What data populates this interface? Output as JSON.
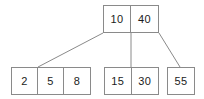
{
  "diagram": {
    "type": "tree",
    "colors": {
      "border": "#8a8a8a",
      "edge": "#8a8a8a",
      "text": "#1c1c1c",
      "background": "#ffffff"
    },
    "root": {
      "id": "root",
      "keys": [
        "10",
        "40"
      ]
    },
    "leaves": [
      {
        "id": "leaf-1",
        "keys": [
          "2",
          "5",
          "8"
        ]
      },
      {
        "id": "leaf-2",
        "keys": [
          "15",
          "30"
        ]
      },
      {
        "id": "leaf-3",
        "keys": [
          "55"
        ]
      }
    ],
    "edges": [
      {
        "id": "edge-left",
        "from": "root",
        "to": "leaf-1",
        "x1": 103,
        "y1": 33,
        "x2": 38,
        "y2": 67
      },
      {
        "id": "edge-middle",
        "from": "root",
        "to": "leaf-2",
        "x1": 131,
        "y1": 33,
        "x2": 131,
        "y2": 67
      },
      {
        "id": "edge-right",
        "from": "root",
        "to": "leaf-3",
        "x1": 159,
        "y1": 33,
        "x2": 180,
        "y2": 67
      }
    ]
  }
}
